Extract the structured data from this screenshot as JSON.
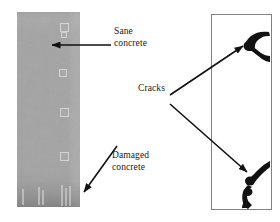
{
  "figure": {
    "type": "annotated-photo-diagram",
    "background_color": "#ffffff",
    "panels": {
      "left": {
        "name": "concrete-specimen-photo",
        "description": "Grey concrete prism specimen photograph",
        "fill_color": "#a3a3a3",
        "x": 17,
        "y": 12,
        "width": 63,
        "height": 195
      },
      "right": {
        "name": "crack-schematic-panel",
        "description": "White rectangle showing black crack patterns",
        "fill_color": "#ffffff",
        "border_color": "#808080",
        "x": 211,
        "y": 14,
        "width": 61,
        "height": 196
      }
    }
  },
  "labels": {
    "sane": {
      "line1": "Sane",
      "line2": "concrete"
    },
    "cracks": {
      "line1": "Cracks"
    },
    "damaged": {
      "line1": "Damaged",
      "line2": "concrete"
    }
  },
  "annotations": {
    "arrow_color": "#111111",
    "arrows": [
      {
        "name": "arrow-to-sane-concrete",
        "from": [
          110,
          45
        ],
        "to": [
          48,
          45
        ]
      },
      {
        "name": "arrow-to-upper-crack",
        "from": [
          170,
          95
        ],
        "to": [
          246,
          44
        ]
      },
      {
        "name": "arrow-to-lower-crack",
        "from": [
          170,
          104
        ],
        "to": [
          250,
          174
        ]
      },
      {
        "name": "arrow-to-damaged-concrete",
        "from": [
          118,
          146
        ],
        "to": [
          80,
          194
        ]
      }
    ]
  },
  "crack_marks": [
    {
      "name": "upper-crack",
      "description": "Y-shaped black crack near top right of schematic"
    },
    {
      "name": "lower-crack",
      "description": "S-shaped black crack near bottom right of schematic"
    }
  ]
}
